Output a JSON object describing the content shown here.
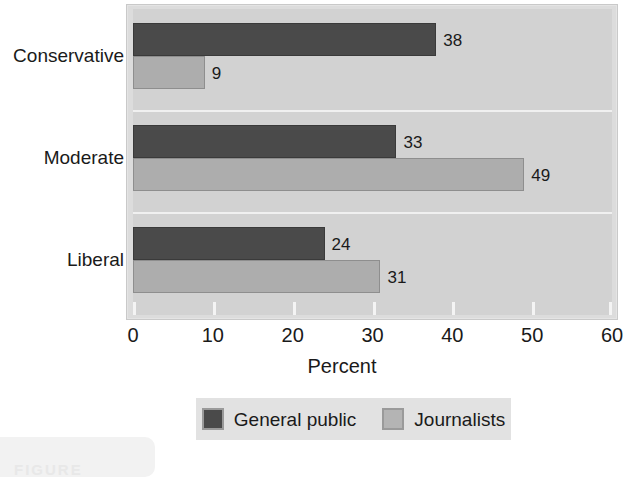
{
  "chart_data": {
    "type": "bar",
    "orientation": "horizontal",
    "title": "",
    "xlabel": "Percent",
    "ylabel": "",
    "xlim": [
      0,
      60
    ],
    "xticks": [
      0,
      10,
      20,
      30,
      40,
      50,
      60
    ],
    "categories": [
      "Conservative",
      "Moderate",
      "Liberal"
    ],
    "grid": true,
    "legend_position": "bottom",
    "series": [
      {
        "name": "General public",
        "color": "#4a4a4a",
        "values": [
          38,
          33,
          24
        ]
      },
      {
        "name": "Journalists",
        "color": "#adadad",
        "values": [
          9,
          49,
          31
        ]
      }
    ]
  },
  "caption": {
    "label": "FIGURE"
  }
}
